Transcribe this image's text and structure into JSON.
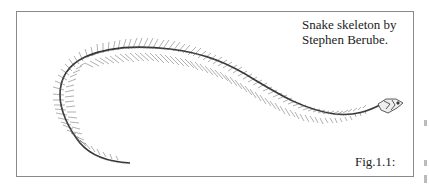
{
  "figure": {
    "caption_lines": [
      "Snake skeleton by",
      "Stephen Berube."
    ],
    "label": "Fig.1.1:",
    "illustration": "snake-skeleton"
  }
}
